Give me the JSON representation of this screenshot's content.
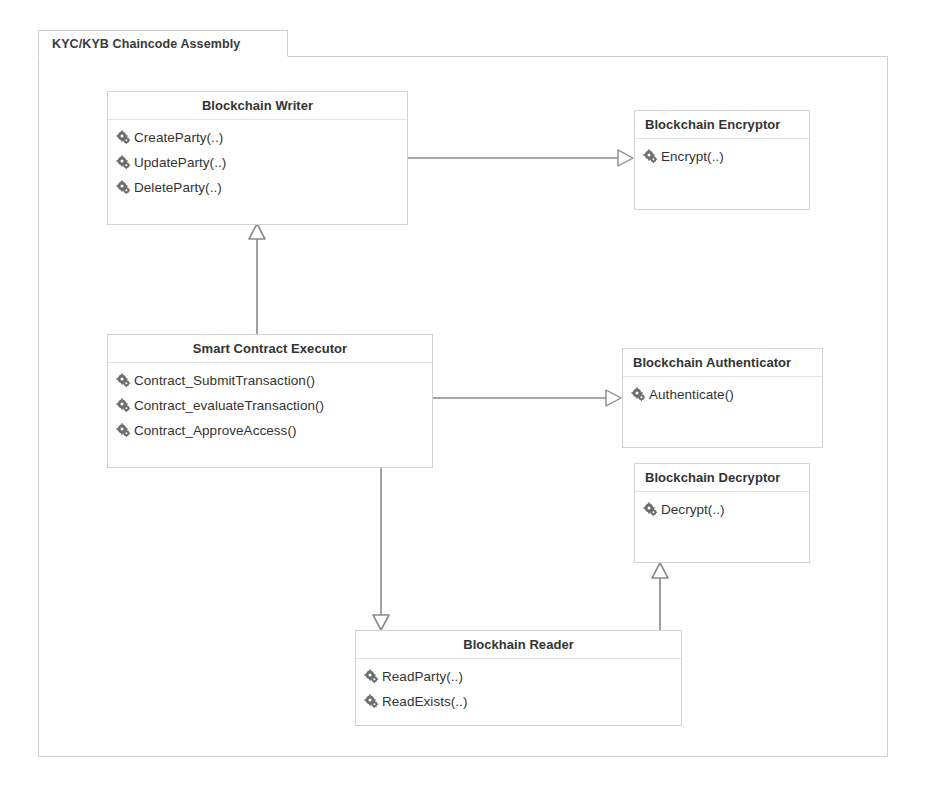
{
  "diagram": {
    "tab_label": "KYC/KYB Chaincode Assembly",
    "type": "uml-class-diagram",
    "icon_names": {
      "method": "gear-icon"
    },
    "colors": {
      "box_border": "#d2d2d2",
      "frame_border": "#cfcfcf",
      "text": "#333333",
      "connector": "#8a8a8a",
      "background": "#ffffff"
    }
  },
  "classes": [
    {
      "id": "blockchain-writer",
      "name": "Blockchain Writer",
      "title_align": "center",
      "members": [
        {
          "icon": "gear-icon",
          "label": "CreateParty(..)"
        },
        {
          "icon": "gear-icon",
          "label": "UpdateParty(..)"
        },
        {
          "icon": "gear-icon",
          "label": "DeleteParty(..)"
        }
      ]
    },
    {
      "id": "blockchain-encryptor",
      "name": "Blockchain Encryptor",
      "title_align": "left",
      "members": [
        {
          "icon": "gear-icon",
          "label": "Encrypt(..)"
        }
      ]
    },
    {
      "id": "smart-contract-executor",
      "name": "Smart Contract Executor",
      "title_align": "center",
      "members": [
        {
          "icon": "gear-icon",
          "label": "Contract_SubmitTransaction()"
        },
        {
          "icon": "gear-icon",
          "label": "Contract_evaluateTransaction()"
        },
        {
          "icon": "gear-icon",
          "label": "Contract_ApproveAccess()"
        }
      ]
    },
    {
      "id": "blockchain-authenticator",
      "name": "Blockchain Authenticator",
      "title_align": "left",
      "members": [
        {
          "icon": "gear-icon",
          "label": "Authenticate()"
        }
      ]
    },
    {
      "id": "blockchain-decryptor",
      "name": "Blockchain Decryptor",
      "title_align": "left",
      "members": [
        {
          "icon": "gear-icon",
          "label": "Decrypt(..)"
        }
      ]
    },
    {
      "id": "blockhain-reader",
      "name": "Blockhain Reader",
      "title_align": "center",
      "members": [
        {
          "icon": "gear-icon",
          "label": "ReadParty(..)"
        },
        {
          "icon": "gear-icon",
          "label": "ReadExists(..)"
        }
      ]
    }
  ],
  "relationships": [
    {
      "id": "executor-to-writer",
      "from": "smart-contract-executor",
      "to": "blockchain-writer",
      "kind": "generalization",
      "arrow_direction": "up"
    },
    {
      "id": "writer-to-encryptor",
      "from": "blockchain-writer",
      "to": "blockchain-encryptor",
      "kind": "generalization",
      "arrow_direction": "right"
    },
    {
      "id": "executor-to-authenticator",
      "from": "smart-contract-executor",
      "to": "blockchain-authenticator",
      "kind": "generalization",
      "arrow_direction": "right"
    },
    {
      "id": "executor-to-reader",
      "from": "smart-contract-executor",
      "to": "blockhain-reader",
      "kind": "generalization",
      "arrow_direction": "down"
    },
    {
      "id": "reader-to-decryptor",
      "from": "blockhain-reader",
      "to": "blockchain-decryptor",
      "kind": "generalization",
      "arrow_direction": "up"
    }
  ]
}
